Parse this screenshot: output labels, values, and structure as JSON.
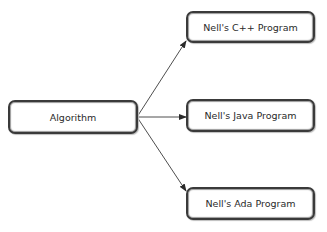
{
  "diagram": {
    "source": {
      "label": "Algorithm"
    },
    "targets": [
      {
        "label": "Nell's C++ Program"
      },
      {
        "label": "Nell's Java Program"
      },
      {
        "label": "Nell's Ada Program"
      }
    ],
    "colors": {
      "stroke": "#3a3a3a",
      "background": "#ffffff",
      "text": "#2a2a2a"
    }
  }
}
